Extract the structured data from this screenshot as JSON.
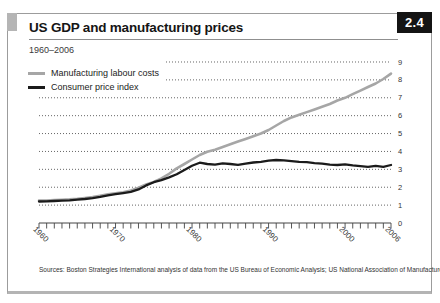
{
  "panel": {
    "figure_number": "2.4",
    "title": "US GDP and manufacturing prices",
    "subtitle": "1960–2006",
    "sources": "Sources: Boston Strategies International analysis of data from the US Bureau of Economic Analysis; US National Association of Manufacturers"
  },
  "colors": {
    "badge_background": "#141414",
    "badge_text": "#ffffff",
    "corner_tab": "#b5b5b5",
    "gridline": "#666666",
    "axis": "#444444"
  },
  "chart_data": {
    "type": "line",
    "title": "US GDP and manufacturing prices",
    "subtitle": "1960–2006",
    "x_start": 1960,
    "x_end": 2006,
    "x_tick_labels": [
      "1960",
      "1970",
      "1980",
      "1990",
      "2000",
      "2006"
    ],
    "x_tick_positions": [
      1960,
      1970,
      1980,
      1990,
      2000,
      2006
    ],
    "ylim": [
      0,
      9
    ],
    "y_ticks": [
      0,
      1,
      2,
      3,
      4,
      5,
      6,
      7,
      8,
      9
    ],
    "grid": "dotted horizontal gridlines at each integer, y-axis labels on right",
    "legend_position": "top-left inside plot",
    "series": [
      {
        "name": "Manufacturing labour costs",
        "color": "#a6a6a6",
        "values": [
          1.25,
          1.26,
          1.28,
          1.3,
          1.32,
          1.35,
          1.4,
          1.45,
          1.52,
          1.6,
          1.66,
          1.72,
          1.82,
          1.98,
          2.15,
          2.3,
          2.5,
          2.75,
          3.05,
          3.3,
          3.55,
          3.8,
          3.98,
          4.1,
          4.25,
          4.4,
          4.55,
          4.7,
          4.85,
          5.0,
          5.2,
          5.45,
          5.7,
          5.9,
          6.05,
          6.2,
          6.35,
          6.5,
          6.65,
          6.85,
          7.0,
          7.2,
          7.4,
          7.6,
          7.8,
          8.05,
          8.35
        ]
      },
      {
        "name": "Consumer price index",
        "color": "#1b1b1b",
        "values": [
          1.2,
          1.21,
          1.23,
          1.25,
          1.27,
          1.3,
          1.34,
          1.39,
          1.46,
          1.54,
          1.61,
          1.67,
          1.74,
          1.88,
          2.1,
          2.28,
          2.4,
          2.55,
          2.72,
          2.96,
          3.2,
          3.37,
          3.3,
          3.26,
          3.33,
          3.3,
          3.25,
          3.32,
          3.38,
          3.42,
          3.48,
          3.52,
          3.5,
          3.46,
          3.42,
          3.4,
          3.35,
          3.32,
          3.26,
          3.24,
          3.28,
          3.22,
          3.18,
          3.14,
          3.2,
          3.14,
          3.24
        ]
      }
    ]
  }
}
